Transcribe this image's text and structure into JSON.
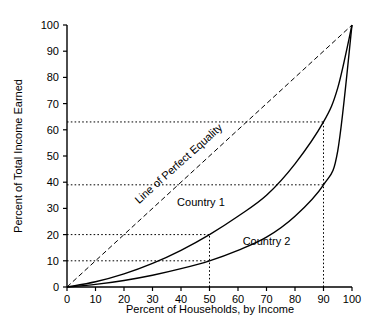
{
  "chart_data": {
    "type": "line",
    "title": "",
    "xlabel": "Percent of Households, by Income",
    "ylabel": "Percent of Total Income Earned",
    "xlim": [
      0,
      100
    ],
    "ylim": [
      0,
      100
    ],
    "grid": false,
    "legend_position": "inline-annotations",
    "xticks": [
      "0",
      "10",
      "20",
      "30",
      "40",
      "50",
      "60",
      "70",
      "80",
      "90",
      "100"
    ],
    "yticks": [
      "0",
      "10",
      "20",
      "30",
      "40",
      "50",
      "60",
      "70",
      "80",
      "90",
      "100"
    ],
    "series": [
      {
        "name": "Line of Perfect Equality",
        "style": "dashed",
        "x": [
          0,
          100
        ],
        "values": [
          0,
          100
        ]
      },
      {
        "name": "Country 1",
        "style": "solid",
        "x": [
          0,
          10,
          20,
          30,
          40,
          50,
          60,
          70,
          80,
          90,
          95,
          100
        ],
        "values": [
          0,
          2,
          5,
          9,
          14,
          20,
          27,
          35,
          47,
          63,
          76,
          100
        ]
      },
      {
        "name": "Country 2",
        "style": "solid",
        "x": [
          0,
          10,
          20,
          30,
          40,
          50,
          60,
          70,
          80,
          90,
          95,
          100
        ],
        "values": [
          0,
          1,
          2.5,
          4.5,
          7,
          10,
          14,
          19,
          27,
          39,
          52,
          100
        ]
      }
    ],
    "annotations": [
      {
        "text": "Line of Perfect Equality",
        "x": 40,
        "y": 46,
        "rotation": -42
      },
      {
        "text": "Country 1",
        "x": 47,
        "y": 31,
        "rotation": 0
      },
      {
        "text": "Country 2",
        "x": 70,
        "y": 16,
        "rotation": 0
      }
    ],
    "reference_lines": [
      {
        "orientation": "horizontal",
        "value": 63,
        "label": "63"
      },
      {
        "orientation": "horizontal",
        "value": 39,
        "label": "39"
      },
      {
        "orientation": "horizontal",
        "value": 20,
        "label": "20"
      },
      {
        "orientation": "horizontal",
        "value": 10,
        "label": "10"
      },
      {
        "orientation": "vertical",
        "value": 50,
        "label": "50"
      },
      {
        "orientation": "vertical",
        "value": 90,
        "label": "90"
      }
    ],
    "marked_points": [
      {
        "series": "Country 1",
        "x": 50,
        "y": 20
      },
      {
        "series": "Country 2",
        "x": 50,
        "y": 10
      },
      {
        "series": "Country 1",
        "x": 90,
        "y": 63
      },
      {
        "series": "Country 2",
        "x": 90,
        "y": 39
      }
    ]
  },
  "colors": {
    "axis": "#000000",
    "curve": "#000000",
    "background": "#ffffff"
  },
  "labels": {
    "country1": "Country 1",
    "country2": "Country 2",
    "equality": "Line of Perfect Equality",
    "xlabel": "Percent of Households, by Income",
    "ylabel": "Percent of Total Income Earned"
  }
}
